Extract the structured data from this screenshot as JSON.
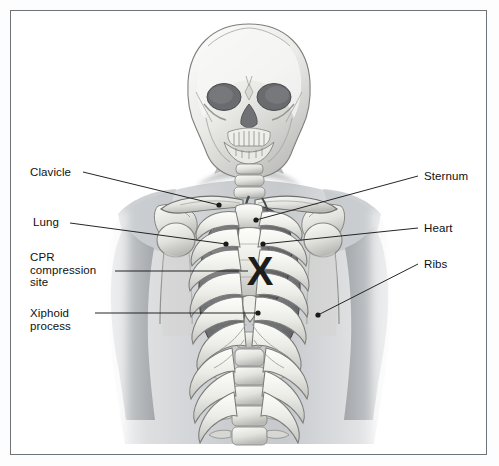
{
  "figure": {
    "background_color": "#ffffff",
    "frame_color": "#6e7378",
    "label_color": "#101010",
    "leader_color": "#1a1a1a",
    "marker": {
      "name": "cpr-x-marker",
      "glyph": "X",
      "color": "#1c1c1c",
      "x": 260,
      "y": 271
    },
    "labels_left": [
      {
        "id": "clavicle",
        "lines": [
          "Clavicle"
        ],
        "x": 30,
        "y": 166,
        "leader": {
          "x1": 83,
          "y1": 172,
          "x2": 219,
          "y2": 205
        },
        "dot": {
          "x": 219,
          "y": 205
        }
      },
      {
        "id": "lung",
        "lines": [
          "Lung"
        ],
        "x": 33,
        "y": 216,
        "leader": {
          "x1": 70,
          "y1": 223,
          "x2": 226,
          "y2": 244
        },
        "dot": {
          "x": 226,
          "y": 244
        }
      },
      {
        "id": "cpr-compression-site",
        "lines": [
          "CPR",
          "compression",
          "site"
        ],
        "x": 30,
        "y": 251,
        "leader": {
          "x1": 115,
          "y1": 271,
          "x2": 248,
          "y2": 271
        },
        "dot": null
      },
      {
        "id": "xiphoid-process",
        "lines": [
          "Xiphoid",
          "process"
        ],
        "x": 30,
        "y": 307,
        "leader": {
          "x1": 95,
          "y1": 313,
          "x2": 258,
          "y2": 313
        },
        "dot": {
          "x": 258,
          "y": 313
        }
      }
    ],
    "labels_right": [
      {
        "id": "sternum",
        "lines": [
          "Sternum"
        ],
        "x": 424,
        "y": 170,
        "leader": {
          "x1": 418,
          "y1": 176,
          "x2": 256,
          "y2": 220
        },
        "dot": {
          "x": 256,
          "y": 220
        }
      },
      {
        "id": "heart",
        "lines": [
          "Heart"
        ],
        "x": 424,
        "y": 222,
        "leader": {
          "x1": 418,
          "y1": 228,
          "x2": 263,
          "y2": 244
        },
        "dot": {
          "x": 263,
          "y": 244
        }
      },
      {
        "id": "ribs",
        "lines": [
          "Ribs"
        ],
        "x": 424,
        "y": 258,
        "leader": {
          "x1": 418,
          "y1": 264,
          "x2": 318,
          "y2": 315
        },
        "dot": {
          "x": 318,
          "y": 315
        }
      }
    ],
    "anatomy": {
      "skull": "skull-anterior",
      "cervical_spine": "cervical-vertebrae",
      "thoracic_spine": "thoracic-vertebrae",
      "lumbar_spine": "lumbar-vertebrae",
      "rib_pairs": 10,
      "sternum": "sternum-body",
      "manubrium": "manubrium",
      "xiphoid": "xiphoid-process",
      "clavicles": 2,
      "scapulae": 2,
      "humeri": 2,
      "lungs": 2,
      "heart": "heart-silhouette"
    },
    "palette": {
      "body_silhouette": "#cfd2d4",
      "bone_light": "#f4f4f2",
      "bone_mid": "#cbcbc6",
      "bone_shadow": "#8f9094",
      "lung_fill": "#6f7074",
      "heart_fill": "#646569",
      "outline": "#2b2b2b"
    }
  }
}
